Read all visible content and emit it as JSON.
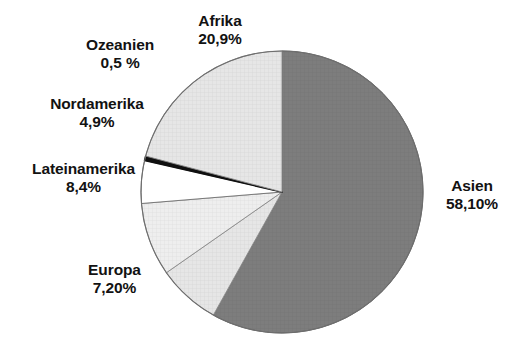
{
  "chart_data": {
    "type": "pie",
    "title": "",
    "subtitle": "",
    "xlabel": "",
    "ylabel": "",
    "legend_position": "none",
    "grid": false,
    "start_angle_deg": 0,
    "direction": "clockwise",
    "categories": [
      "Asien",
      "Europa",
      "Lateinamerika",
      "Nordamerika",
      "Ozeanien",
      "Afrika"
    ],
    "values": [
      58.1,
      7.2,
      8.4,
      4.9,
      0.5,
      20.9
    ],
    "value_labels": [
      "58,10%",
      "7,20%",
      "8,4%",
      "4,9%",
      "0,5 %",
      "20,9%"
    ],
    "slices": [
      {
        "name": "Asien",
        "value": 58.1,
        "value_label": "58,10%",
        "color": "#7d7d7d",
        "stroke": "#5f5f5f",
        "start_deg": 0.0,
        "end_deg": 209.16,
        "label_position": "right"
      },
      {
        "name": "Europa",
        "value": 7.2,
        "value_label": "7,20%",
        "color": "#e3e3e3",
        "stroke": "#8a8a8a",
        "start_deg": 209.16,
        "end_deg": 235.08,
        "label_position": "bottom-left"
      },
      {
        "name": "Lateinamerika",
        "value": 8.4,
        "value_label": "8,4%",
        "color": "#ececec",
        "stroke": "#8a8a8a",
        "start_deg": 235.08,
        "end_deg": 265.32,
        "label_position": "left"
      },
      {
        "name": "Nordamerika",
        "value": 4.9,
        "value_label": "4,9%",
        "color": "#ffffff",
        "stroke": "#6f6f6f",
        "start_deg": 265.32,
        "end_deg": 282.96,
        "label_position": "upper-left"
      },
      {
        "name": "Ozeanien",
        "value": 0.5,
        "value_label": "0,5 %",
        "color": "#101010",
        "stroke": "#101010",
        "start_deg": 282.96,
        "end_deg": 284.76,
        "label_position": "top-left"
      },
      {
        "name": "Afrika",
        "value": 20.9,
        "value_label": "20,9%",
        "color": "#dedede",
        "stroke": "#8a8a8a",
        "start_deg": 284.76,
        "end_deg": 360.0,
        "label_position": "top"
      }
    ],
    "geometry": {
      "center_x": 282,
      "center_y": 192,
      "radius": 141
    },
    "colors": {
      "background": "#ffffff",
      "text": "#121212",
      "asien": "#7d7d7d",
      "afrika": "#dedede",
      "lateinamerika": "#ececec",
      "europa": "#e3e3e3",
      "nordamerika": "#ffffff",
      "ozeanien": "#101010"
    }
  },
  "labels": {
    "afrika": {
      "name": "Afrika",
      "value": "20,9%"
    },
    "ozeanien": {
      "name": "Ozeanien",
      "value": "0,5 %"
    },
    "nordamerika": {
      "name": "Nordamerika",
      "value": "4,9%"
    },
    "lateinamerika": {
      "name": "Lateinamerika",
      "value": "8,4%"
    },
    "europa": {
      "name": "Europa",
      "value": "7,20%"
    },
    "asien": {
      "name": "Asien",
      "value": "58,10%"
    }
  }
}
